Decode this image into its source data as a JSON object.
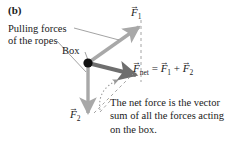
{
  "figure": {
    "panel_label": "(b)",
    "background_color": "#ffffff",
    "text_color": "#1a1a1a"
  },
  "labels": {
    "pulling_forces_line1": "Pulling forces",
    "pulling_forces_line2": "of the ropes",
    "box": "Box",
    "f1": "F",
    "f1_sub": "1",
    "f2": "F",
    "f2_sub": "2",
    "fnet": "F",
    "fnet_sub": "net",
    "equals": "=",
    "eq_f1": "F",
    "eq_f1_sub": "1",
    "plus": "+",
    "eq_f2": "F",
    "eq_f2_sub": "2",
    "vector_accent": "→"
  },
  "caption": {
    "line1": "The net force is the vector",
    "line2": "sum of all the forces acting",
    "line3": "on the box."
  },
  "colors": {
    "vector_light": "#a8a8a8",
    "vector_dark": "#6e6e6e",
    "box_dot": "#111111",
    "leader_line": "#8c8c8c",
    "dashed_line": "#9a9a9a",
    "dotted_arc": "#9a9a9a"
  },
  "geometry": {
    "box_point": [
      88,
      63
    ],
    "f1_tip": [
      141,
      25
    ],
    "f2_tip": [
      88,
      116
    ],
    "fnet_tip": [
      139,
      76
    ],
    "dashed_vertical_from": [
      141,
      25
    ],
    "dashed_vertical_to": [
      141,
      79
    ],
    "dashed_diagonal_from": [
      96,
      111
    ],
    "dashed_diagonal_to": [
      133,
      74
    ]
  },
  "icons": {
    "arrowhead": "vector-arrowhead",
    "box_dot": "box-point-marker"
  }
}
